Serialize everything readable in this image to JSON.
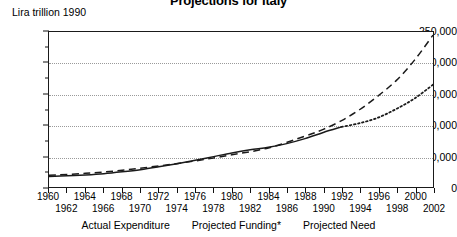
{
  "title": "Projections for Italy",
  "y_unit_label": "Lira trillion 1990",
  "legend": [
    {
      "label": "Actual Expenditure",
      "name": "legend-actual-expenditure"
    },
    {
      "label": "Projected Funding*",
      "name": "legend-projected-funding"
    },
    {
      "label": "Projected Need",
      "name": "legend-projected-need"
    }
  ],
  "chart_data": {
    "type": "line",
    "title": "Projections for Italy",
    "xlabel": "",
    "ylabel": "Lira trillion 1990",
    "xlim": [
      1960,
      2002
    ],
    "ylim": [
      0,
      250000
    ],
    "grid": true,
    "legend_position": "bottom",
    "y_ticks": [
      0,
      50000,
      100000,
      150000,
      200000,
      250000
    ],
    "y_tick_labels": [
      "0",
      "50,000",
      "100,000",
      "150,000",
      "200,000",
      "250,000"
    ],
    "y_minor_tick_interval": 25000,
    "x_ticks": [
      1960,
      1962,
      1964,
      1966,
      1968,
      1970,
      1972,
      1974,
      1976,
      1978,
      1980,
      1982,
      1984,
      1986,
      1988,
      1990,
      1992,
      1994,
      1996,
      1998,
      2000,
      2002
    ],
    "x_tick_labels_row0": [
      "1960",
      "1964",
      "1968",
      "1972",
      "1976",
      "1980",
      "1984",
      "1988",
      "1992",
      "1996",
      "2000"
    ],
    "x_tick_labels_row1": [
      "1962",
      "1966",
      "1970",
      "1974",
      "1978",
      "1982",
      "1986",
      "1990",
      "1994",
      "1998",
      "2002"
    ],
    "series": [
      {
        "name": "Actual Expenditure",
        "style": "solid",
        "color": "#1a1a1a",
        "x": [
          1960,
          1962,
          1964,
          1966,
          1968,
          1970,
          1972,
          1974,
          1976,
          1978,
          1980,
          1982,
          1984,
          1986,
          1988,
          1990,
          1992
        ],
        "values": [
          17000,
          18000,
          19500,
          21500,
          24500,
          28000,
          32500,
          37500,
          43000,
          49000,
          55000,
          60000,
          64000,
          70000,
          78000,
          88000,
          97000
        ]
      },
      {
        "name": "Projected Need",
        "style": "dashed",
        "color": "#1a1a1a",
        "x": [
          1960,
          1964,
          1968,
          1972,
          1976,
          1980,
          1984,
          1988,
          1990,
          1992,
          1994,
          1996,
          1998,
          2000,
          2002
        ],
        "values": [
          19000,
          22000,
          27000,
          34000,
          42000,
          52000,
          63000,
          82000,
          93000,
          107000,
          125000,
          147000,
          172000,
          205000,
          245000
        ]
      },
      {
        "name": "Projected Funding*",
        "style": "dotted",
        "color": "#1a1a1a",
        "x": [
          1992,
          1994,
          1996,
          1998,
          2000,
          2002
        ],
        "values": [
          97000,
          103000,
          112000,
          126000,
          143000,
          165000
        ]
      }
    ]
  }
}
